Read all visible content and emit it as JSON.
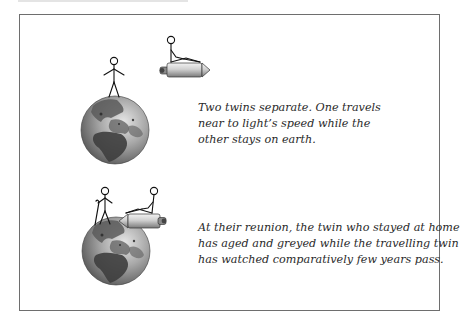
{
  "figure": {
    "panels": [
      {
        "id": "separation",
        "caption_lines": [
          "Two twins separate. One travels",
          "near to light’s speed while the",
          "other stays on earth."
        ],
        "elements": [
          "earth-globe",
          "standing-twin",
          "rocket-with-seated-twin"
        ],
        "rocket_direction": "right"
      },
      {
        "id": "reunion",
        "caption_lines": [
          "At their reunion, the twin who stayed at home",
          "has aged and greyed while the travelling twin",
          "has watched comparatively few years pass."
        ],
        "elements": [
          "earth-globe",
          "aged-twin-with-cane",
          "rocket-with-seated-twin"
        ],
        "rocket_direction": "left"
      }
    ]
  },
  "colors": {
    "frame_border": "#6e6e6e",
    "text": "#2a2a2a",
    "globe_ocean": "#9a9a9a",
    "globe_land": "#555555",
    "rocket_body": "#c8c8c8",
    "stroke": "#111111"
  }
}
